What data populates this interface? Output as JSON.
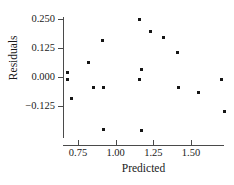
{
  "chart_data": {
    "type": "scatter",
    "title": "",
    "subtitle": "",
    "xlabel": "Predicted",
    "ylabel": "Residuals",
    "xlim": [
      0.62,
      1.78
    ],
    "ylim": [
      -0.255,
      0.262
    ],
    "grid": false,
    "legend": null,
    "xticks": [
      0.75,
      1.0,
      1.25,
      1.5
    ],
    "xtick_labels": [
      "0.75",
      "1.00",
      "1.25",
      "1.50"
    ],
    "yticks": [
      0.25,
      0.125,
      0.0,
      -0.125
    ],
    "ytick_labels": [
      "0.250",
      "0.125",
      "0.000",
      "−0.125"
    ],
    "marker": "square",
    "marker_color": "#161616",
    "axis_color": "#4a4a4a",
    "n_points": 19,
    "points": [
      {
        "x": 0.68,
        "y": 0.02
      },
      {
        "x": 0.68,
        "y": -0.012
      },
      {
        "x": 0.71,
        "y": -0.092
      },
      {
        "x": 0.82,
        "y": 0.062
      },
      {
        "x": 0.85,
        "y": -0.045
      },
      {
        "x": 0.91,
        "y": 0.157
      },
      {
        "x": 0.92,
        "y": -0.047
      },
      {
        "x": 0.92,
        "y": -0.225
      },
      {
        "x": 1.16,
        "y": 0.247
      },
      {
        "x": 1.16,
        "y": -0.012
      },
      {
        "x": 1.17,
        "y": 0.033
      },
      {
        "x": 1.17,
        "y": -0.232
      },
      {
        "x": 1.23,
        "y": 0.198
      },
      {
        "x": 1.32,
        "y": 0.172
      },
      {
        "x": 1.41,
        "y": 0.105
      },
      {
        "x": 1.42,
        "y": -0.047
      },
      {
        "x": 1.55,
        "y": -0.068
      },
      {
        "x": 1.7,
        "y": -0.012
      },
      {
        "x": 1.72,
        "y": -0.148
      }
    ]
  }
}
